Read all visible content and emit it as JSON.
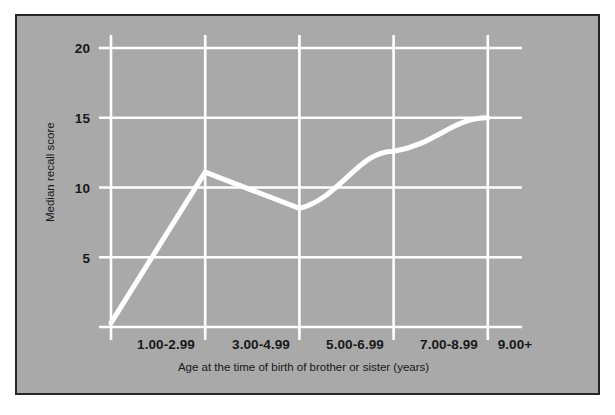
{
  "chart_data": {
    "type": "line",
    "title": "",
    "subtitle": "",
    "xlabel": "Age at the time of birth of brother or sister (years)",
    "ylabel": "Median recall score",
    "categories": [
      "1.00-2.99",
      "3.00-4.99",
      "5.00-6.99",
      "7.00-8.99",
      "9.00+"
    ],
    "values": [
      0.3,
      11.1,
      8.5,
      12.6,
      15.0
    ],
    "series": [
      {
        "name": "Median recall score",
        "values": [
          0.3,
          11.1,
          8.5,
          12.6,
          15.0
        ]
      }
    ],
    "ylim": [
      0,
      21
    ],
    "yticks": [
      5,
      10,
      15,
      20
    ],
    "ytick_labels": [
      "5",
      "10",
      "15",
      "20"
    ],
    "xtick_labels": [
      "1.00-2.99",
      "3.00-4.99",
      "5.00-6.99",
      "7.00-8.99",
      "9.00+"
    ],
    "grid": true,
    "grid_color": "#ffffff",
    "legend": false,
    "legend_position": "none",
    "line_color": "#ffffff",
    "line_width": 5,
    "markers": false,
    "smoothing": "slight-curve-on-last-segments",
    "background_color": "#a9a9a9",
    "border_color": "#262626",
    "text_color": "#18181a",
    "annotations": []
  },
  "figure": {
    "panel_label": "chart-panel",
    "canvas_label": "plot-area"
  }
}
